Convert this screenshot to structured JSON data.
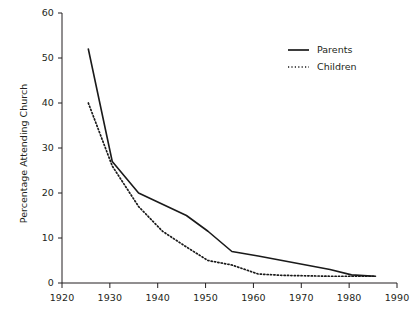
{
  "chart_data": {
    "type": "line",
    "title": "",
    "xlabel": "",
    "ylabel": "Percentage Attending Church",
    "xlim": [
      1920,
      1990
    ],
    "ylim": [
      0,
      60
    ],
    "xticks": [
      1920,
      1930,
      1940,
      1950,
      1960,
      1970,
      1980,
      1990
    ],
    "xtick_labels": [
      "1920",
      "1930",
      "1940",
      "1950",
      "1960",
      "1970",
      "1980",
      "1990"
    ],
    "yticks": [
      0,
      10,
      20,
      30,
      40,
      50,
      60
    ],
    "ytick_labels": [
      "0",
      "10",
      "20",
      "30",
      "40",
      "50",
      "60"
    ],
    "grid": false,
    "legend_position": "upper right",
    "series": [
      {
        "name": "Parents",
        "style": "solid",
        "color": "#1a1a1a",
        "x": [
          1925.5,
          1930.5,
          1936,
          1941,
          1946,
          1950.5,
          1955.5,
          1961,
          1966,
          1971,
          1976,
          1980.5,
          1985.5
        ],
        "values": [
          52,
          27,
          20,
          17.5,
          15,
          11.5,
          7,
          6,
          5,
          4,
          3,
          1.8,
          1.5
        ]
      },
      {
        "name": "Children",
        "style": "dotted",
        "color": "#1a1a1a",
        "x": [
          1925.5,
          1930.5,
          1936,
          1941,
          1946,
          1950.5,
          1955.5,
          1961,
          1966,
          1971,
          1976,
          1980.5,
          1985.5
        ],
        "values": [
          40,
          26,
          17,
          11.5,
          8,
          5,
          4,
          2,
          1.7,
          1.6,
          1.5,
          1.5,
          1.5
        ]
      }
    ]
  },
  "legend": {
    "items": [
      {
        "label": "Parents",
        "style": "solid"
      },
      {
        "label": "Children",
        "style": "dotted"
      }
    ]
  },
  "axes": {
    "y_title": "Percentage Attending Church"
  }
}
